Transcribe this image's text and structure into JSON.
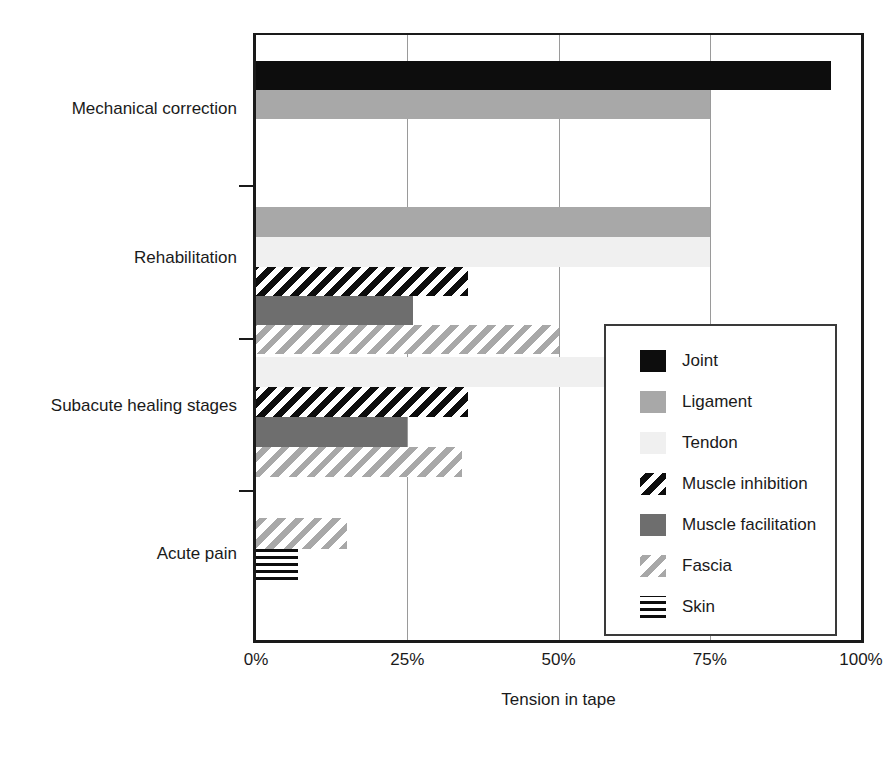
{
  "chart_data": {
    "type": "bar",
    "orientation": "horizontal",
    "title": "",
    "xlabel": "Tension in tape",
    "ylabel": "",
    "xlim": [
      0,
      100
    ],
    "xticks": [
      "0%",
      "25%",
      "50%",
      "75%",
      "100%"
    ],
    "xtick_values": [
      0,
      25,
      50,
      75,
      100
    ],
    "grid": true,
    "legend_position": "center-right",
    "categories": [
      "Mechanical correction",
      "Rehabilitation",
      "Subacute healing stages",
      "Acute pain"
    ],
    "series": [
      {
        "name": "Joint",
        "color": "#0d0d0d",
        "pattern": "solid",
        "values": [
          95,
          null,
          null,
          null
        ]
      },
      {
        "name": "Ligament",
        "color": "#a8a8a8",
        "pattern": "solid",
        "values": [
          75,
          75,
          null,
          null
        ]
      },
      {
        "name": "Tendon",
        "color": "#f0f0f0",
        "pattern": "solid",
        "values": [
          null,
          75,
          75,
          null
        ]
      },
      {
        "name": "Muscle inhibition",
        "color": "#0d0d0d",
        "pattern": "diagonal-hatch-dark",
        "values": [
          null,
          35,
          35,
          null
        ]
      },
      {
        "name": "Muscle facilitation",
        "color": "#6e6e6e",
        "pattern": "solid",
        "values": [
          null,
          26,
          25,
          null
        ]
      },
      {
        "name": "Fascia",
        "color": "#a8a8a8",
        "pattern": "diagonal-hatch-light",
        "values": [
          null,
          50,
          34,
          15
        ]
      },
      {
        "name": "Skin",
        "color": "#0d0d0d",
        "pattern": "horizontal-lines",
        "values": [
          null,
          null,
          null,
          7
        ]
      }
    ],
    "bars": [
      {
        "category": "Mechanical correction",
        "series": "Joint",
        "value": 95,
        "fill": "joint",
        "top": 26,
        "height": 29
      },
      {
        "category": "Mechanical correction",
        "series": "Ligament",
        "value": 75,
        "fill": "ligament",
        "top": 55,
        "height": 29
      },
      {
        "category": "Rehabilitation",
        "series": "Ligament",
        "value": 75,
        "fill": "ligament",
        "top": 172,
        "height": 30
      },
      {
        "category": "Rehabilitation",
        "series": "Tendon",
        "value": 75,
        "fill": "tendon",
        "top": 202,
        "height": 30
      },
      {
        "category": "Rehabilitation",
        "series": "Muscle inhibition",
        "value": 35,
        "fill": "muscle-inhibition",
        "top": 232,
        "height": 29
      },
      {
        "category": "Rehabilitation",
        "series": "Muscle facilitation",
        "value": 26,
        "fill": "muscle-facilitation",
        "top": 261,
        "height": 29
      },
      {
        "category": "Rehabilitation",
        "series": "Fascia",
        "value": 50,
        "fill": "fascia",
        "top": 290,
        "height": 29
      },
      {
        "category": "Subacute healing stages",
        "series": "Tendon",
        "value": 75,
        "fill": "tendon",
        "top": 322,
        "height": 30
      },
      {
        "category": "Subacute healing stages",
        "series": "Muscle inhibition",
        "value": 35,
        "fill": "muscle-inhibition",
        "top": 352,
        "height": 30
      },
      {
        "category": "Subacute healing stages",
        "series": "Muscle facilitation",
        "value": 25,
        "fill": "muscle-facilitation",
        "top": 382,
        "height": 30
      },
      {
        "category": "Subacute healing stages",
        "series": "Fascia",
        "value": 34,
        "fill": "fascia",
        "top": 412,
        "height": 30
      },
      {
        "category": "Acute pain",
        "series": "Fascia",
        "value": 15,
        "fill": "fascia",
        "top": 483,
        "height": 31
      },
      {
        "category": "Acute pain",
        "series": "Skin",
        "value": 7,
        "fill": "skin",
        "top": 514,
        "height": 31
      }
    ]
  },
  "axis": {
    "x_title": "Tension in tape",
    "x_ticks": [
      {
        "label": "0%",
        "value": 0
      },
      {
        "label": "25%",
        "value": 25
      },
      {
        "label": "50%",
        "value": 50
      },
      {
        "label": "75%",
        "value": 75
      },
      {
        "label": "100%",
        "value": 100
      }
    ],
    "y_categories": [
      {
        "label": "Mechanical correction",
        "center": 76
      },
      {
        "label": "Rehabilitation",
        "center": 225
      },
      {
        "label": "Subacute healing stages",
        "center": 373
      },
      {
        "label": "Acute pain",
        "center": 521
      }
    ],
    "y_tick_positions": [
      152,
      305,
      457
    ]
  },
  "legend": {
    "items": [
      {
        "label": "Joint",
        "fill": "joint"
      },
      {
        "label": "Ligament",
        "fill": "ligament"
      },
      {
        "label": "Tendon",
        "fill": "tendon"
      },
      {
        "label": "Muscle inhibition",
        "fill": "muscle-inhibition"
      },
      {
        "label": "Muscle facilitation",
        "fill": "muscle-facilitation"
      },
      {
        "label": "Fascia",
        "fill": "fascia"
      },
      {
        "label": "Skin",
        "fill": "skin"
      }
    ]
  },
  "colors": {
    "joint": "#0d0d0d",
    "ligament": "#a8a8a8",
    "tendon": "#f0f0f0",
    "muscle_facilitation": "#6e6e6e",
    "hatch_dark": "#0d0d0d",
    "hatch_light": "#a8a8a8",
    "axis": "#1a1a1a",
    "grid": "#9a9a9a"
  }
}
